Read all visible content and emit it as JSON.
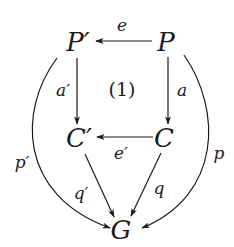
{
  "diagram": {
    "type": "commutative-diagram",
    "objects": {
      "p_prime": "P′",
      "p": "P",
      "c_prime": "C′",
      "c": "C",
      "g": "G"
    },
    "region_label": "(1)",
    "arrows": {
      "e": {
        "label": "e",
        "from": "P",
        "to": "P′"
      },
      "a_prime": {
        "label": "a′",
        "from": "P′",
        "to": "C′"
      },
      "a": {
        "label": "a",
        "from": "P",
        "to": "C"
      },
      "e_prime": {
        "label": "e′",
        "from": "C",
        "to": "C′"
      },
      "q_prime": {
        "label": "q′",
        "from": "C′",
        "to": "G"
      },
      "q": {
        "label": "q",
        "from": "C",
        "to": "G"
      },
      "p_prime_curve": {
        "label": "p′",
        "from": "P′",
        "to": "G"
      },
      "p_curve": {
        "label": "p",
        "from": "P",
        "to": "G"
      }
    },
    "colors": {
      "ink": "#1a1a1a",
      "background": "#ffffff"
    }
  }
}
